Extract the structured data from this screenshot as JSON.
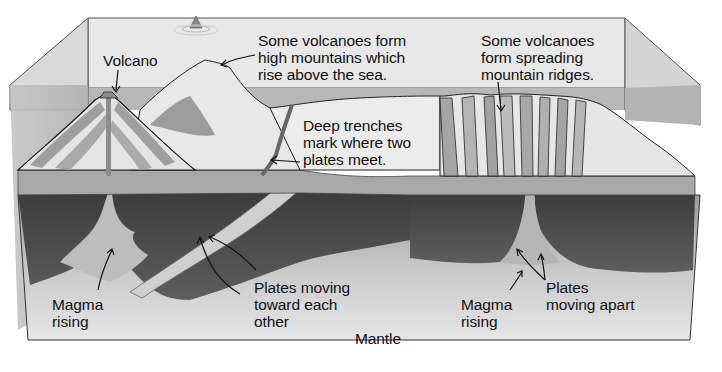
{
  "labels": {
    "volcano": "Volcano",
    "high_mountains": "Some volcanoes form\nhigh mountains which\nrise above the sea.",
    "deep_trenches": "Deep trenches\nmark where two\nplates meet.",
    "spreading_ridges": "Some volcanoes\nform spreading\nmountain ridges.",
    "magma_rising_left": "Magma\nrising",
    "plates_toward": "Plates moving\ntoward each\nother",
    "mantle": "Mantle",
    "magma_rising_right": "Magma\nrising",
    "plates_apart": "Plates\nmoving apart"
  },
  "colors": {
    "sky_panel": "#e9e9e9",
    "sea_water": "#b9b9b9",
    "crust_light": "#f2f2f2",
    "crust_layer": "#a9a9a9",
    "lithosphere_dark": "#4a4a4a",
    "mantle_light": "#d6d6d6",
    "outline": "#1a1a1a",
    "text": "#111111"
  }
}
